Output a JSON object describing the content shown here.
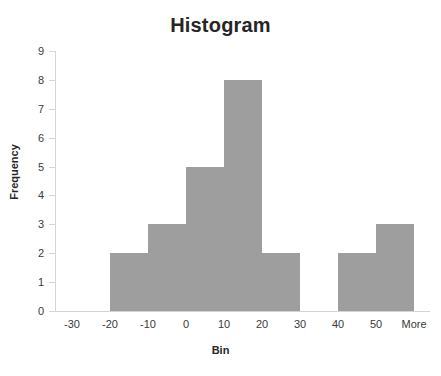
{
  "chart_data": {
    "type": "bar",
    "title": "Histogram",
    "xlabel": "Bin",
    "ylabel": "Frequency",
    "categories": [
      "-30",
      "-20",
      "-10",
      "0",
      "10",
      "20",
      "30",
      "40",
      "50",
      "More"
    ],
    "values": [
      0,
      2,
      3,
      5,
      8,
      2,
      0,
      2,
      3,
      0
    ],
    "ylim": [
      0,
      9
    ],
    "yticks": [
      0,
      1,
      2,
      3,
      4,
      5,
      6,
      7,
      8,
      9
    ],
    "grid": false,
    "legend": null,
    "bar_color": "#9e9e9e",
    "axis_color": "#d4d4d4",
    "text_color": "#262626"
  },
  "chart": {
    "title": "Histogram",
    "x_axis_title": "Bin",
    "y_axis_title": "Frequency",
    "y_tick_labels": [
      "9",
      "8",
      "7",
      "6",
      "5",
      "4",
      "3",
      "2",
      "1",
      "0"
    ],
    "x_tick_labels": [
      "-30",
      "-20",
      "-10",
      "0",
      "10",
      "20",
      "30",
      "40",
      "50",
      "More"
    ]
  }
}
